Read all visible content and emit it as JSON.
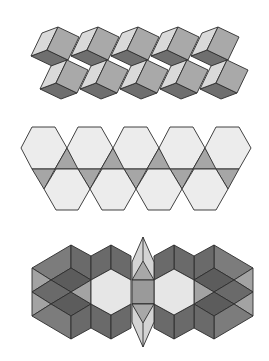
{
  "colors": {
    "stroke": "#2e2e2e",
    "background": "#ffffff",
    "cube_light": "#d9d9d9",
    "cube_medium": "#a9a9a9",
    "cube_dark": "#6f6f6f",
    "hex_light": "#ececec",
    "triangle_gray": "#a6a6a6",
    "band3_dark": "#6a6a6a",
    "band3_darker": "#5c5c5c",
    "band3_mid": "#7c7c7c",
    "band3_lightgray": "#a3a3a3",
    "band3_hex": "#e6e6e6",
    "band3_spike": "#d4d4d4",
    "band3_square": "#9a9a9a",
    "band3_inner_tri": "#a8a8a8"
  },
  "figures": [
    {
      "id": "cube-tiling",
      "label": "rhombus cube tiling band",
      "rows": [
        {
          "top": [
            58,
            27
          ],
          "count": 5,
          "period": 40
        },
        {
          "top": [
            67,
            60
          ],
          "count": 5,
          "period": 40
        }
      ],
      "cube_vectors": {
        "T": [
          0,
          0
        ],
        "Rt": [
          21,
          10
        ],
        "Bm": [
          10,
          33
        ],
        "In": [
          -11,
          23
        ],
        "L": [
          -27,
          29
        ],
        "Lt": [
          -16,
          6
        ],
        "Bt": [
          -6,
          39
        ]
      }
    },
    {
      "id": "hexagon-triangle-band",
      "label": "hexagons and triangles band",
      "top_row": {
        "left": 21,
        "count": 5,
        "period": 46
      },
      "bottom_row": {
        "left": 44,
        "count": 4,
        "period": 46
      },
      "y": {
        "top": 127,
        "mid_top": 148,
        "line": 169,
        "mid_bottom": 189,
        "bottom": 210
      }
    },
    {
      "id": "symmetric-rhombus-band",
      "label": "mirror-symmetric rhombus band",
      "mirror_x": 285
    }
  ]
}
